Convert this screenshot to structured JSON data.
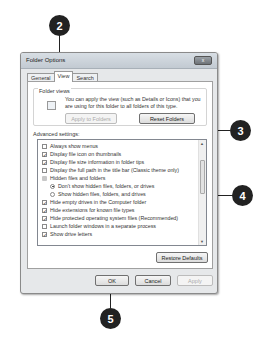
{
  "callouts": [
    {
      "number": "2",
      "target": "view-tab"
    },
    {
      "number": "3",
      "target": "apply-to-folders-button"
    },
    {
      "number": "4",
      "target": "advanced-settings-list"
    },
    {
      "number": "5",
      "target": "ok-button"
    }
  ],
  "dialog": {
    "title": "Folder Options",
    "close_label": "x",
    "tabs": [
      {
        "label": "General",
        "active": false
      },
      {
        "label": "View",
        "active": true
      },
      {
        "label": "Search",
        "active": false
      }
    ],
    "folder_views": {
      "label": "Folder views",
      "description": "You can apply the view (such as Details or Icons) that you are using for this folder to all folders of this type.",
      "apply_button": "Apply to Folders",
      "reset_button": "Reset Folders"
    },
    "advanced": {
      "label": "Advanced settings:",
      "items": [
        {
          "type": "checkbox",
          "checked": false,
          "label": "Always show menus",
          "indent": 0
        },
        {
          "type": "checkbox",
          "checked": true,
          "label": "Display file icon on thumbnails",
          "indent": 0
        },
        {
          "type": "checkbox",
          "checked": true,
          "label": "Display file size information in folder tips",
          "indent": 0
        },
        {
          "type": "checkbox",
          "checked": false,
          "label": "Display the full path in the title bar (Classic theme only)",
          "indent": 0
        },
        {
          "type": "folder",
          "label": "Hidden files and folders",
          "indent": 0
        },
        {
          "type": "radio",
          "checked": true,
          "label": "Don't show hidden files, folders, or drives",
          "indent": 1
        },
        {
          "type": "radio",
          "checked": false,
          "label": "Show hidden files, folders, and drives",
          "indent": 1
        },
        {
          "type": "checkbox",
          "checked": true,
          "label": "Hide empty drives in the Computer folder",
          "indent": 0
        },
        {
          "type": "checkbox",
          "checked": true,
          "label": "Hide extensions for known file types",
          "indent": 0
        },
        {
          "type": "checkbox",
          "checked": true,
          "label": "Hide protected operating system files (Recommended)",
          "indent": 0
        },
        {
          "type": "checkbox",
          "checked": false,
          "label": "Launch folder windows in a separate process",
          "indent": 0
        },
        {
          "type": "checkbox",
          "checked": true,
          "label": "Show drive letters",
          "indent": 0
        }
      ],
      "restore_button": "Restore Defaults"
    },
    "footer": {
      "ok": "OK",
      "cancel": "Cancel",
      "apply": "Apply"
    }
  }
}
